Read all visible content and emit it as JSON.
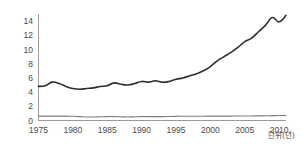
{
  "chart_data": {
    "type": "line",
    "title": "",
    "subtitle": "",
    "xlabel": "단위(년)",
    "ylabel": "",
    "xlim": [
      1975,
      2011
    ],
    "ylim": [
      0,
      15
    ],
    "grid": false,
    "legend": "none",
    "x_ticks": [
      "1975",
      "1980",
      "1985",
      "1990",
      "1995",
      "2000",
      "2005",
      "2010"
    ],
    "x_tick_values": [
      1975,
      1980,
      1985,
      1990,
      1995,
      2000,
      2005,
      2010
    ],
    "y_ticks": [
      "0",
      "2",
      "4",
      "6",
      "8",
      "10",
      "12",
      "14"
    ],
    "y_tick_values": [
      0,
      2,
      4,
      6,
      8,
      10,
      12,
      14
    ],
    "x": [
      1975,
      1976,
      1977,
      1978,
      1979,
      1980,
      1981,
      1982,
      1983,
      1984,
      1985,
      1986,
      1987,
      1988,
      1989,
      1990,
      1991,
      1992,
      1993,
      1994,
      1995,
      1996,
      1997,
      1998,
      1999,
      2000,
      2001,
      2002,
      2003,
      2004,
      2005,
      2006,
      2007,
      2008,
      2009,
      2010,
      2011
    ],
    "series": [
      {
        "name": "series-upper",
        "color": "#2e2e2e",
        "width": 1.6,
        "values": [
          4.8,
          4.9,
          5.4,
          5.2,
          4.8,
          4.5,
          4.4,
          4.5,
          4.6,
          4.8,
          4.9,
          5.3,
          5.1,
          5.0,
          5.2,
          5.5,
          5.4,
          5.6,
          5.4,
          5.5,
          5.8,
          6.0,
          6.3,
          6.6,
          7.0,
          7.6,
          8.4,
          9.0,
          9.6,
          10.3,
          11.1,
          11.6,
          12.5,
          13.4,
          14.5,
          13.9,
          14.8
        ]
      },
      {
        "name": "series-lower",
        "color": "#7d7d7d",
        "width": 1.1,
        "values": [
          0.62,
          0.62,
          0.62,
          0.62,
          0.61,
          0.6,
          0.55,
          0.5,
          0.5,
          0.52,
          0.55,
          0.55,
          0.52,
          0.5,
          0.52,
          0.55,
          0.55,
          0.55,
          0.55,
          0.56,
          0.58,
          0.6,
          0.6,
          0.6,
          0.6,
          0.62,
          0.62,
          0.62,
          0.62,
          0.63,
          0.63,
          0.64,
          0.65,
          0.66,
          0.68,
          0.7,
          0.7
        ]
      }
    ]
  },
  "axes": {
    "axis_color": "#9a9a9a",
    "tick_text_color": "#4a4a4a"
  }
}
